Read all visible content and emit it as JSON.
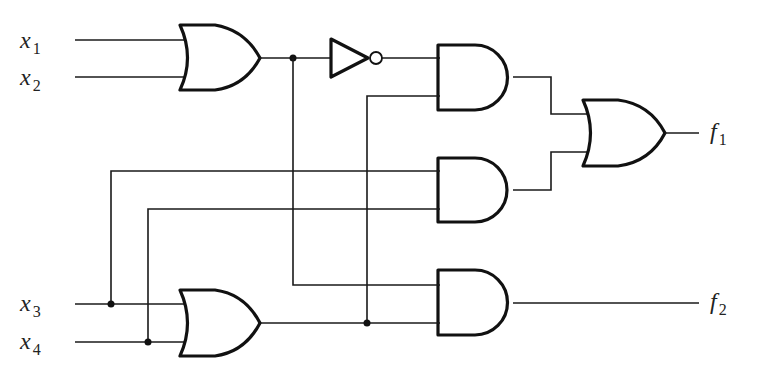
{
  "diagram": {
    "type": "logic-circuit",
    "inputs": [
      {
        "id": "x1",
        "base": "x",
        "sub": "1"
      },
      {
        "id": "x2",
        "base": "x",
        "sub": "2"
      },
      {
        "id": "x3",
        "base": "x",
        "sub": "3"
      },
      {
        "id": "x4",
        "base": "x",
        "sub": "4"
      }
    ],
    "outputs": [
      {
        "id": "f1",
        "base": "f",
        "sub": "1"
      },
      {
        "id": "f2",
        "base": "f",
        "sub": "2"
      }
    ],
    "gates": [
      {
        "id": "or1",
        "type": "OR",
        "inputs": [
          "x1",
          "x2"
        ]
      },
      {
        "id": "not1",
        "type": "NOT",
        "inputs": [
          "or1"
        ]
      },
      {
        "id": "or2",
        "type": "OR",
        "inputs": [
          "x3",
          "x4"
        ]
      },
      {
        "id": "and1",
        "type": "AND",
        "inputs": [
          "not1",
          "or2"
        ]
      },
      {
        "id": "and2",
        "type": "AND",
        "inputs": [
          "x3",
          "x4"
        ]
      },
      {
        "id": "and3",
        "type": "AND",
        "inputs": [
          "or1",
          "or2"
        ]
      },
      {
        "id": "or3",
        "type": "OR",
        "inputs": [
          "and1",
          "and2"
        ],
        "output": "f1"
      }
    ],
    "f2_source": "and3",
    "colors": {
      "line": "#111111",
      "background": "#ffffff"
    }
  }
}
